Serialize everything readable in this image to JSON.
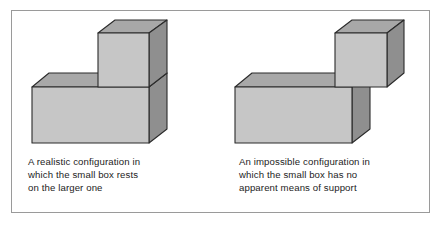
{
  "figure": {
    "frame_color": "#9a9a9a",
    "background": "#ffffff"
  },
  "palette": {
    "face_front": "#c6c6c6",
    "face_top": "#a8a8a8",
    "face_side": "#8f8f8f",
    "outline": "#2b2b2b",
    "caption_text": "#1c1c1c",
    "frame": "#9a9a9a"
  },
  "panels": [
    {
      "id": "realistic",
      "caption": "A realistic configuration in\nwhich the small box rests\non the larger one",
      "scene_name": "realistic-box-stack",
      "description": "A large rectangular block with a small cube resting on its upper right surface",
      "shapes": [
        {
          "name": "small-box-top-face",
          "fill": "#a8a8a8"
        },
        {
          "name": "small-box-front-face",
          "fill": "#c6c6c6"
        },
        {
          "name": "small-box-right-face",
          "fill": "#8f8f8f"
        },
        {
          "name": "large-box-top-face",
          "fill": "#a8a8a8"
        },
        {
          "name": "large-box-front-face",
          "fill": "#c6c6c6"
        },
        {
          "name": "large-box-right-face",
          "fill": "#8f8f8f"
        }
      ]
    },
    {
      "id": "impossible",
      "caption": "An impossible configuration in\nwhich the small box has no\napparent means of support",
      "scene_name": "impossible-box-stack",
      "description": "A large rectangular block with a small cube appearing to float beyond its right edge",
      "shapes": [
        {
          "name": "small-box-top-face",
          "fill": "#a8a8a8"
        },
        {
          "name": "small-box-front-face",
          "fill": "#c6c6c6"
        },
        {
          "name": "small-box-right-face",
          "fill": "#8f8f8f"
        },
        {
          "name": "large-box-top-face",
          "fill": "#a8a8a8"
        },
        {
          "name": "large-box-front-face",
          "fill": "#c6c6c6"
        },
        {
          "name": "large-box-right-face",
          "fill": "#8f8f8f"
        }
      ]
    }
  ]
}
